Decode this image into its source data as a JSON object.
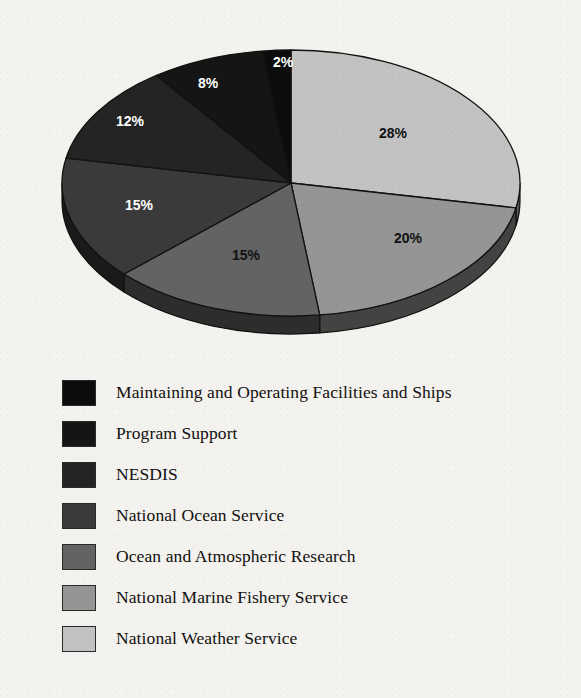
{
  "background_color": "#f3f2ef",
  "chart_data": {
    "type": "pie",
    "title": "",
    "subtitle": "",
    "xlabel": "",
    "ylabel": "",
    "legend_position": "below",
    "grid": false,
    "start_angle_deg": 0,
    "direction": "clockwise",
    "three_d": true,
    "value_unit": "%",
    "categories": [
      "National Weather Service",
      "National Marine Fishery Service",
      "Ocean and Atmospheric Research",
      "National Ocean Service",
      "NESDIS",
      "Program Support",
      "Maintaining and Operating Facilities and Ships"
    ],
    "values": [
      28,
      20,
      15,
      15,
      12,
      8,
      2
    ],
    "data_labels": [
      "28%",
      "20%",
      "15%",
      "15%",
      "12%",
      "8%",
      "2%"
    ],
    "slice_colors": [
      "#c2c2c2",
      "#959595",
      "#636363",
      "#3a3a3a",
      "#242424",
      "#151515",
      "#0c0c0c"
    ],
    "label_text_colors": [
      "#111111",
      "#111111",
      "#111111",
      "#ffffff",
      "#ffffff",
      "#ffffff",
      "#ffffff"
    ]
  },
  "pie": {
    "center_x": 291,
    "center_y": 183,
    "radius_x": 229,
    "radius_y": 133,
    "depth": 18,
    "rim_color": "#0a0a0a",
    "outline_color": "#14120f",
    "slices": [
      {
        "name": "national-weather-service",
        "label": "28%",
        "value": 28,
        "color": "#c2c2c2",
        "start_deg": 0,
        "end_deg": 100.8,
        "label_x": 393,
        "label_y": 134,
        "label_tone": "dark"
      },
      {
        "name": "national-marine-fishery-service",
        "label": "20%",
        "value": 20,
        "color": "#959595",
        "start_deg": 100.8,
        "end_deg": 172.8,
        "label_x": 408,
        "label_y": 239,
        "label_tone": "dark"
      },
      {
        "name": "ocean-and-atmospheric-research",
        "label": "15%",
        "value": 15,
        "color": "#636363",
        "start_deg": 172.8,
        "end_deg": 226.8,
        "label_x": 246,
        "label_y": 256,
        "label_tone": "dark"
      },
      {
        "name": "national-ocean-service",
        "label": "15%",
        "value": 15,
        "color": "#3a3a3a",
        "start_deg": 226.8,
        "end_deg": 280.8,
        "label_x": 139,
        "label_y": 206,
        "label_tone": "light"
      },
      {
        "name": "nesdis",
        "label": "12%",
        "value": 12,
        "color": "#242424",
        "start_deg": 280.8,
        "end_deg": 324.0,
        "label_x": 130,
        "label_y": 122,
        "label_tone": "light"
      },
      {
        "name": "program-support",
        "label": "8%",
        "value": 8,
        "color": "#151515",
        "start_deg": 324.0,
        "end_deg": 352.8,
        "label_x": 208,
        "label_y": 84,
        "label_tone": "light"
      },
      {
        "name": "maintaining-and-operating-facilities-and-ships",
        "label": "2%",
        "value": 2,
        "color": "#0c0c0c",
        "start_deg": 352.8,
        "end_deg": 360.0,
        "label_x": 283,
        "label_y": 63,
        "label_tone": "light"
      }
    ]
  },
  "legend": {
    "items": [
      {
        "label": "Maintaining and Operating Facilities and Ships",
        "color": "#0c0c0c",
        "percent": "2%",
        "key": "maintaining-and-operating-facilities-and-ships"
      },
      {
        "label": "Program Support",
        "color": "#151515",
        "percent": "8%",
        "key": "program-support"
      },
      {
        "label": "NESDIS",
        "color": "#242424",
        "percent": "12%",
        "key": "nesdis"
      },
      {
        "label": "National Ocean Service",
        "color": "#3a3a3a",
        "percent": "15%",
        "key": "national-ocean-service"
      },
      {
        "label": "Ocean and Atmospheric Research",
        "color": "#636363",
        "percent": "15%",
        "key": "ocean-and-atmospheric-research"
      },
      {
        "label": "National Marine Fishery Service",
        "color": "#959595",
        "percent": "20%",
        "key": "national-marine-fishery-service"
      },
      {
        "label": "National Weather Service",
        "color": "#c2c2c2",
        "percent": "28%",
        "key": "national-weather-service"
      }
    ]
  }
}
